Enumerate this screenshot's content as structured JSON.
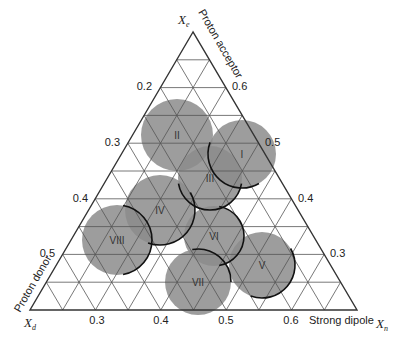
{
  "diagram": {
    "type": "ternary",
    "triangle": {
      "apex": [
        193,
        32
      ],
      "bottom_left": [
        30,
        310
      ],
      "bottom_right": [
        357,
        310
      ],
      "subdivisions": 10
    },
    "axes": {
      "top": {
        "symbol": "X",
        "subscript": "e",
        "title": "Proton acceptor"
      },
      "left": {
        "symbol": "X",
        "subscript": "d",
        "title": "Proton donor"
      },
      "right": {
        "symbol": "X",
        "subscript": "n",
        "title": "Strong dipole"
      }
    },
    "ticks": {
      "left": [
        {
          "label": "0.2",
          "x": 152,
          "y": 90
        },
        {
          "label": "0.3",
          "x": 120,
          "y": 146
        },
        {
          "label": "0.4",
          "x": 88,
          "y": 202
        },
        {
          "label": "0.5",
          "x": 55,
          "y": 257
        }
      ],
      "right": [
        {
          "label": "0.6",
          "x": 232,
          "y": 90
        },
        {
          "label": "0.5",
          "x": 265,
          "y": 146
        },
        {
          "label": "0.4",
          "x": 298,
          "y": 202
        },
        {
          "label": "0.3",
          "x": 330,
          "y": 257
        }
      ],
      "bottom": [
        {
          "label": "0.3",
          "x": 97,
          "y": 324
        },
        {
          "label": "0.4",
          "x": 161,
          "y": 324
        },
        {
          "label": "0.5",
          "x": 226,
          "y": 324
        },
        {
          "label": "0.6",
          "x": 291,
          "y": 324
        }
      ]
    },
    "groups": [
      {
        "label": "I",
        "cx": 242,
        "cy": 154,
        "r": 34,
        "outline": "bottom-left"
      },
      {
        "label": "II",
        "cx": 177,
        "cy": 135,
        "r": 36,
        "outline": "none"
      },
      {
        "label": "III",
        "cx": 210,
        "cy": 178,
        "r": 32,
        "outline": "bottom"
      },
      {
        "label": "IV",
        "cx": 160,
        "cy": 210,
        "r": 35,
        "outline": "bottom-right"
      },
      {
        "label": "V",
        "cx": 262,
        "cy": 265,
        "r": 33,
        "outline": "bottom-right"
      },
      {
        "label": "VI",
        "cx": 214,
        "cy": 236,
        "r": 30,
        "outline": "right"
      },
      {
        "label": "VII",
        "cx": 198,
        "cy": 282,
        "r": 33,
        "outline": "top-right"
      },
      {
        "label": "VIII",
        "cx": 117,
        "cy": 240,
        "r": 35,
        "outline": "right"
      }
    ],
    "colors": {
      "circle_fill": "#8c8c8c",
      "grid": "#555555",
      "outline": "#111111"
    }
  }
}
